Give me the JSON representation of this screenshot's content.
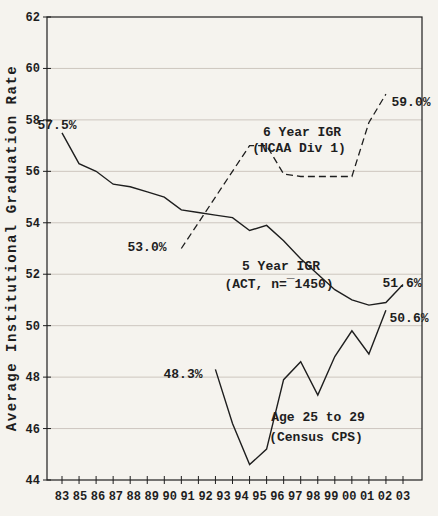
{
  "colors": {
    "ink": "#1e1e1e",
    "grid": "#cdc6bf",
    "background": "#f5f3ee"
  },
  "chart_data": {
    "type": "line",
    "title": "",
    "xlabel": "",
    "ylabel": "Average Institutional Graduation Rate",
    "ylim": [
      44,
      62
    ],
    "grid": "horizontal",
    "legend_position": "inline-annotations",
    "ytick_labels": [
      "62",
      "60",
      "58",
      "56",
      "54",
      "52",
      "50",
      "48",
      "46",
      "44"
    ],
    "xtick_labels": [
      "83",
      "85",
      "86",
      "87",
      "88",
      "89",
      "90",
      "91",
      "92",
      "93",
      "94",
      "95",
      "96",
      "97",
      "98",
      "99",
      "00",
      "01",
      "02",
      "03"
    ],
    "series": [
      {
        "name": "5 Year IGR (ACT, n=¯1450)",
        "line_style": "solid",
        "years": [
          1983,
          1984,
          1985,
          1986,
          1987,
          1988,
          1989,
          1990,
          1991,
          1992,
          1993,
          1994,
          1995,
          1996,
          1997,
          1998,
          1999,
          2000,
          2001,
          2002,
          2003
        ],
        "values": [
          57.5,
          56.3,
          56.0,
          55.5,
          55.4,
          55.2,
          55.0,
          54.5,
          54.4,
          54.3,
          54.2,
          53.7,
          53.9,
          53.3,
          52.6,
          52.0,
          51.4,
          51.0,
          50.8,
          50.9,
          51.6
        ]
      },
      {
        "name": "6 Year IGR (NCAA Div 1)",
        "line_style": "dashed",
        "years": [
          1990,
          1991,
          1992,
          1993,
          1994,
          1995,
          1996,
          1997,
          1998,
          1999,
          2000,
          2001,
          2002
        ],
        "values": [
          53.0,
          54.0,
          55.0,
          56.0,
          57.0,
          57.0,
          55.9,
          55.8,
          55.8,
          55.8,
          55.8,
          57.9,
          59.0
        ]
      },
      {
        "name": "Age 25 to 29 (Census CPS)",
        "line_style": "solid",
        "years": [
          1992,
          1993,
          1994,
          1995,
          1996,
          1997,
          1998,
          1999,
          2000,
          2001,
          2002
        ],
        "values": [
          48.3,
          46.2,
          44.6,
          45.2,
          47.9,
          48.6,
          47.3,
          48.8,
          49.8,
          48.9,
          50.6
        ]
      }
    ],
    "annotations": {
      "act_start": "57.5%",
      "act_end": "51.6%",
      "act_line1": "5 Year IGR",
      "act_line2": "(ACT, n=¯1450)",
      "ncaa_start": "53.0%",
      "ncaa_end": "59.0%",
      "ncaa_line1": "6 Year IGR",
      "ncaa_line2": "(NCAA Div 1)",
      "census_start": "48.3%",
      "census_end": "50.6%",
      "census_line1": "Age 25 to 29",
      "census_line2": "(Census CPS)"
    }
  }
}
